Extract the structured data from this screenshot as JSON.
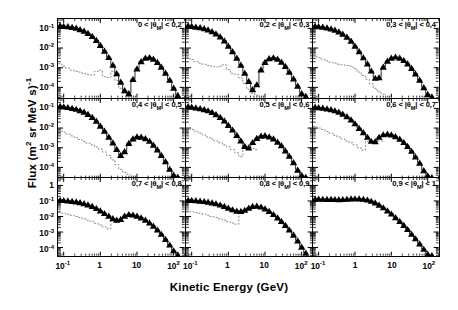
{
  "figure": {
    "xlabel": "Kinetic Energy (GeV)",
    "ylabel_main": "Flux (m",
    "ylabel_sup1": "2",
    "ylabel_mid": " sr MeV s)",
    "ylabel_sup2": "-1"
  },
  "chart_data": {
    "type": "line",
    "title": "",
    "xlabel": "Kinetic Energy (GeV)",
    "ylabel": "Flux (m^2 sr MeV s)^-1",
    "xscale": "log",
    "yscale": "log",
    "xlim": [
      0.07,
      200
    ],
    "grid": false,
    "legend_position": "none",
    "marker": "filled-triangle",
    "secondary_style": "dashed-gray-histogram",
    "panel_layout": {
      "rows": 3,
      "cols": 3
    },
    "x_ticks": [
      {
        "value": 0.1,
        "label": "10",
        "exp": "-1"
      },
      {
        "value": 1,
        "label": "1",
        "exp": ""
      },
      {
        "value": 10,
        "label": "10",
        "exp": ""
      },
      {
        "value": 100,
        "label": "10",
        "exp": "2"
      }
    ],
    "y_ticks_top_rows": [
      {
        "value": 0.1,
        "label": "10",
        "exp": "-1"
      },
      {
        "value": 0.01,
        "label": "10",
        "exp": "-2"
      },
      {
        "value": 0.001,
        "label": "10",
        "exp": "-3"
      },
      {
        "value": 0.0001,
        "label": "10",
        "exp": "-4"
      }
    ],
    "y_ticks_bottom_row": [
      {
        "value": 1,
        "label": "1",
        "exp": ""
      },
      {
        "value": 0.1,
        "label": "10",
        "exp": "-1"
      },
      {
        "value": 0.01,
        "label": "10",
        "exp": "-2"
      },
      {
        "value": 0.001,
        "label": "10",
        "exp": "-3"
      },
      {
        "value": 0.0001,
        "label": "10",
        "exp": "-4"
      }
    ],
    "panels": [
      {
        "index": 0,
        "label_pre": "0 < |",
        "label_sym": "θ",
        "label_sub": "M",
        "label_post": "| < 0,2",
        "ylim": [
          3e-05,
          0.3
        ],
        "x": [
          0.08,
          0.1,
          0.13,
          0.17,
          0.22,
          0.28,
          0.36,
          0.46,
          0.6,
          0.78,
          1.0,
          1.3,
          1.7,
          2.2,
          2.8,
          3.6,
          4.6,
          6.0,
          7.8,
          10,
          13,
          17,
          22,
          28,
          36,
          46,
          60,
          78,
          100,
          130
        ],
        "y": [
          0.14,
          0.13,
          0.125,
          0.115,
          0.105,
          0.09,
          0.075,
          0.058,
          0.04,
          0.025,
          0.014,
          0.0072,
          0.0034,
          0.0014,
          0.00052,
          0.00019,
          7e-05,
          5e-05,
          0.00026,
          0.0009,
          0.0021,
          0.0032,
          0.0034,
          0.0028,
          0.0019,
          0.0011,
          0.00055,
          0.00024,
          9.5e-05,
          4e-05
        ],
        "secondary_x": [
          0.08,
          0.1,
          0.13,
          0.17,
          0.22,
          0.28,
          0.36,
          0.46,
          0.6,
          0.78,
          1.0,
          1.3,
          1.7,
          2.2,
          2.8,
          3.6,
          4.6,
          6.0
        ],
        "secondary_y": [
          0.0016,
          0.0012,
          0.00095,
          0.00075,
          0.00065,
          0.0006,
          0.0005,
          0.00045,
          0.00042,
          0.00065,
          0.00075,
          0.00035,
          0.00032,
          0.00065,
          0.00022,
          9e-05,
          5e-05,
          3.5e-05
        ]
      },
      {
        "index": 1,
        "label_pre": "0,2 < |",
        "label_sym": "θ",
        "label_sub": "M",
        "label_post": "| < 0,3",
        "ylim": [
          3e-05,
          0.3
        ],
        "x": [
          0.08,
          0.1,
          0.13,
          0.17,
          0.22,
          0.28,
          0.36,
          0.46,
          0.6,
          0.78,
          1.0,
          1.3,
          1.7,
          2.2,
          2.8,
          3.6,
          4.6,
          6.0,
          7.8,
          10,
          13,
          17,
          22,
          28,
          36,
          46,
          60,
          78,
          100,
          130
        ],
        "y": [
          0.14,
          0.13,
          0.12,
          0.112,
          0.1,
          0.086,
          0.07,
          0.054,
          0.038,
          0.024,
          0.013,
          0.0068,
          0.0032,
          0.0014,
          0.00055,
          0.00021,
          8e-05,
          0.00014,
          0.0008,
          0.0019,
          0.003,
          0.0033,
          0.0028,
          0.002,
          0.0012,
          0.00062,
          0.00028,
          0.00012,
          5e-05,
          3.6e-05
        ],
        "secondary_x": [
          0.08,
          0.1,
          0.13,
          0.17,
          0.22,
          0.28,
          0.36,
          0.46,
          0.6,
          0.78,
          1.0,
          1.3,
          1.7,
          2.2,
          2.8,
          3.6,
          4.6,
          6.0
        ],
        "secondary_y": [
          0.0032,
          0.0026,
          0.0021,
          0.0017,
          0.0015,
          0.0013,
          0.0012,
          0.0011,
          0.0012,
          0.0014,
          0.0008,
          0.0005,
          0.00045,
          0.0003,
          0.00016,
          8e-05,
          5e-05,
          4e-05
        ]
      },
      {
        "index": 2,
        "label_pre": "0,3 < |",
        "label_sym": "θ",
        "label_sub": "M",
        "label_post": "| < 0,4",
        "ylim": [
          3e-05,
          0.3
        ],
        "x": [
          0.08,
          0.1,
          0.13,
          0.17,
          0.22,
          0.28,
          0.36,
          0.46,
          0.6,
          0.78,
          1.0,
          1.3,
          1.7,
          2.2,
          2.8,
          3.6,
          4.6,
          6.0,
          7.8,
          10,
          13,
          17,
          22,
          28,
          36,
          46,
          60,
          78,
          100,
          130
        ],
        "y": [
          0.135,
          0.125,
          0.118,
          0.108,
          0.097,
          0.083,
          0.068,
          0.052,
          0.037,
          0.023,
          0.013,
          0.0068,
          0.0033,
          0.0016,
          0.0007,
          0.0003,
          0.00032,
          0.0011,
          0.0022,
          0.0032,
          0.0036,
          0.0032,
          0.0024,
          0.0016,
          0.00095,
          0.0005,
          0.00024,
          0.0001,
          4.5e-05,
          3.4e-05
        ],
        "secondary_x": [
          0.08,
          0.1,
          0.13,
          0.17,
          0.22,
          0.28,
          0.36,
          0.46,
          0.6,
          0.78,
          1.0,
          1.3,
          1.7,
          2.2,
          2.8,
          3.6,
          4.6,
          6.0
        ],
        "secondary_y": [
          0.004,
          0.0033,
          0.0027,
          0.0022,
          0.0019,
          0.0017,
          0.0015,
          0.0014,
          0.0013,
          0.0012,
          0.0009,
          0.0006,
          0.0004,
          0.00026,
          0.00015,
          9e-05,
          6e-05,
          4.5e-05
        ]
      },
      {
        "index": 3,
        "label_pre": "0,4 < |",
        "label_sym": "θ",
        "label_sub": "M",
        "label_post": "| < 0,5",
        "ylim": [
          3e-05,
          0.3
        ],
        "x": [
          0.08,
          0.1,
          0.13,
          0.17,
          0.22,
          0.28,
          0.36,
          0.46,
          0.6,
          0.78,
          1.0,
          1.3,
          1.7,
          2.2,
          2.8,
          3.6,
          4.6,
          6.0,
          7.8,
          10,
          13,
          17,
          22,
          28,
          36,
          46,
          60,
          78,
          100,
          130
        ],
        "y": [
          0.13,
          0.122,
          0.114,
          0.104,
          0.093,
          0.08,
          0.066,
          0.051,
          0.036,
          0.023,
          0.013,
          0.0072,
          0.0036,
          0.0018,
          0.00085,
          0.00042,
          0.00065,
          0.0017,
          0.0029,
          0.0037,
          0.0036,
          0.003,
          0.0022,
          0.0014,
          0.0008,
          0.00042,
          0.0002,
          8.5e-05,
          4.2e-05,
          3.3e-05
        ],
        "secondary_x": [
          0.08,
          0.1,
          0.13,
          0.17,
          0.22,
          0.28,
          0.36,
          0.46,
          0.6,
          0.78,
          1.0,
          1.3,
          1.7,
          2.2,
          2.8,
          3.6,
          4.6,
          6.0
        ],
        "secondary_y": [
          0.0075,
          0.0062,
          0.005,
          0.004,
          0.0032,
          0.0026,
          0.0021,
          0.0017,
          0.0014,
          0.0011,
          0.00085,
          0.0006,
          0.0004,
          0.00024,
          0.00014,
          8e-05,
          5.5e-05,
          4.5e-05
        ]
      },
      {
        "index": 4,
        "label_pre": "0,5 < |",
        "label_sym": "θ",
        "label_sub": "M",
        "label_post": "| < 0,6",
        "ylim": [
          3e-05,
          0.3
        ],
        "x": [
          0.08,
          0.1,
          0.13,
          0.17,
          0.22,
          0.28,
          0.36,
          0.46,
          0.6,
          0.78,
          1.0,
          1.3,
          1.7,
          2.2,
          2.8,
          3.6,
          4.6,
          6.0,
          7.8,
          10,
          13,
          17,
          22,
          28,
          36,
          46,
          60,
          78,
          100,
          130
        ],
        "y": [
          0.125,
          0.118,
          0.11,
          0.1,
          0.09,
          0.078,
          0.065,
          0.05,
          0.036,
          0.024,
          0.014,
          0.0082,
          0.0044,
          0.0023,
          0.0012,
          0.001,
          0.0019,
          0.0031,
          0.004,
          0.0042,
          0.0037,
          0.0029,
          0.002,
          0.0013,
          0.00072,
          0.00038,
          0.00018,
          7.5e-05,
          4e-05,
          3.2e-05
        ],
        "secondary_x": [
          0.08,
          0.1,
          0.13,
          0.17,
          0.22,
          0.28,
          0.36,
          0.46,
          0.6,
          0.78,
          1.0,
          1.3,
          1.7,
          2.2,
          2.8,
          3.6,
          4.6,
          6.0
        ],
        "secondary_y": [
          0.01,
          0.0085,
          0.007,
          0.0056,
          0.0044,
          0.0035,
          0.0028,
          0.0022,
          0.0018,
          0.0014,
          0.0011,
          0.0008,
          0.00055,
          0.00035,
          0.0012,
          0.001,
          0.0009,
          0.0008
        ]
      },
      {
        "index": 5,
        "label_pre": "0,6 < |",
        "label_sym": "θ",
        "label_sub": "M",
        "label_post": "| < 0,7",
        "ylim": [
          3e-05,
          0.3
        ],
        "x": [
          0.08,
          0.1,
          0.13,
          0.17,
          0.22,
          0.28,
          0.36,
          0.46,
          0.6,
          0.78,
          1.0,
          1.3,
          1.7,
          2.2,
          2.8,
          3.6,
          4.6,
          6.0,
          7.8,
          10,
          13,
          17,
          22,
          28,
          36,
          46,
          60,
          78,
          100,
          130
        ],
        "y": [
          0.12,
          0.113,
          0.106,
          0.098,
          0.089,
          0.078,
          0.066,
          0.052,
          0.039,
          0.027,
          0.017,
          0.01,
          0.006,
          0.0035,
          0.0022,
          0.0021,
          0.0035,
          0.0047,
          0.005,
          0.0046,
          0.0038,
          0.0028,
          0.0019,
          0.0012,
          0.00068,
          0.00035,
          0.00017,
          7e-05,
          3.8e-05,
          3.1e-05
        ],
        "secondary_x": [
          0.08,
          0.1,
          0.13,
          0.17,
          0.22,
          0.28,
          0.36,
          0.46,
          0.6,
          0.78,
          1.0,
          1.3,
          1.7,
          2.2,
          2.8,
          3.6,
          4.6,
          6.0
        ],
        "secondary_y": [
          0.012,
          0.01,
          0.0085,
          0.0068,
          0.0054,
          0.0043,
          0.0035,
          0.0028,
          0.0022,
          0.0018,
          0.0014,
          0.001,
          0.00075,
          0.0021,
          0.0021,
          0.0021,
          0.0022,
          0.0022
        ]
      },
      {
        "index": 6,
        "label_pre": "0,7 < |",
        "label_sym": "θ",
        "label_sub": "M",
        "label_post": "| < 0,8",
        "ylim": [
          3e-05,
          3.0
        ],
        "x": [
          0.08,
          0.1,
          0.13,
          0.17,
          0.22,
          0.28,
          0.36,
          0.46,
          0.6,
          0.78,
          1.0,
          1.3,
          1.7,
          2.2,
          2.8,
          3.6,
          4.6,
          6.0,
          7.8,
          10,
          13,
          17,
          22,
          28,
          36,
          46,
          60,
          78,
          100,
          130
        ],
        "y": [
          0.115,
          0.11,
          0.105,
          0.098,
          0.09,
          0.081,
          0.07,
          0.058,
          0.046,
          0.034,
          0.024,
          0.016,
          0.011,
          0.0075,
          0.006,
          0.0068,
          0.011,
          0.014,
          0.013,
          0.011,
          0.0085,
          0.006,
          0.004,
          0.0025,
          0.0014,
          0.00075,
          0.00035,
          0.00015,
          6.5e-05,
          3.5e-05
        ],
        "secondary_x": [
          0.08,
          0.1,
          0.13,
          0.17,
          0.22,
          0.28,
          0.36,
          0.46,
          0.6,
          0.78,
          1.0,
          1.3,
          1.7,
          2.2,
          2.8
        ],
        "secondary_y": [
          0.018,
          0.016,
          0.014,
          0.012,
          0.01,
          0.0085,
          0.007,
          0.0058,
          0.0046,
          0.0036,
          0.0028,
          0.0021,
          0.0016,
          0.006,
          0.0058
        ]
      },
      {
        "index": 7,
        "label_pre": "0,8 < |",
        "label_sym": "θ",
        "label_sub": "M",
        "label_post": "| < 0,9",
        "ylim": [
          3e-05,
          3.0
        ],
        "x": [
          0.08,
          0.1,
          0.13,
          0.17,
          0.22,
          0.28,
          0.36,
          0.46,
          0.6,
          0.78,
          1.0,
          1.3,
          1.7,
          2.2,
          2.8,
          3.6,
          4.6,
          6.0,
          7.8,
          10,
          13,
          17,
          22,
          28,
          36,
          46,
          60,
          78,
          100,
          130
        ],
        "y": [
          0.115,
          0.112,
          0.108,
          0.102,
          0.095,
          0.087,
          0.078,
          0.068,
          0.057,
          0.046,
          0.036,
          0.028,
          0.023,
          0.022,
          0.026,
          0.036,
          0.046,
          0.048,
          0.042,
          0.032,
          0.022,
          0.014,
          0.0085,
          0.005,
          0.0028,
          0.0014,
          0.00065,
          0.00028,
          0.00011,
          4.5e-05
        ],
        "secondary_x": [
          0.08,
          0.1,
          0.13,
          0.17,
          0.22,
          0.28,
          0.36,
          0.46,
          0.6,
          0.78,
          1.0,
          1.3,
          1.7,
          2.2,
          2.8
        ],
        "secondary_y": [
          0.022,
          0.02,
          0.018,
          0.016,
          0.014,
          0.012,
          0.01,
          0.0085,
          0.007,
          0.0058,
          0.0046,
          0.0038,
          0.0032,
          0.021,
          0.025
        ]
      },
      {
        "index": 8,
        "label_pre": "0,9 < |",
        "label_sym": "θ",
        "label_sub": "M",
        "label_post": "| < 1",
        "ylim": [
          3e-05,
          3.0
        ],
        "x": [
          0.08,
          0.1,
          0.13,
          0.17,
          0.22,
          0.28,
          0.36,
          0.46,
          0.6,
          0.78,
          1.0,
          1.3,
          1.7,
          2.2,
          2.8,
          3.6,
          4.6,
          6.0,
          7.8,
          10,
          13,
          17,
          22,
          28,
          36,
          46,
          60,
          78,
          100,
          130
        ],
        "y": [
          0.135,
          0.135,
          0.134,
          0.132,
          0.13,
          0.128,
          0.126,
          0.128,
          0.134,
          0.14,
          0.144,
          0.142,
          0.134,
          0.12,
          0.1,
          0.078,
          0.056,
          0.038,
          0.024,
          0.015,
          0.0088,
          0.005,
          0.0028,
          0.0015,
          0.00075,
          0.00038,
          0.00018,
          8e-05,
          3.8e-05,
          3.2e-05
        ],
        "secondary_x": [],
        "secondary_y": []
      }
    ]
  }
}
